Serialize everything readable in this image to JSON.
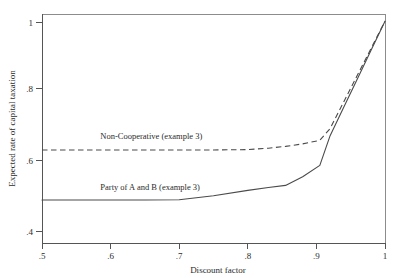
{
  "chart_data": {
    "type": "line",
    "title": "",
    "xlabel": "Discount factor",
    "ylabel": "Expected rate of capital taxation",
    "xlim": [
      0.5,
      1.0
    ],
    "ylim": [
      0.38,
      1.02
    ],
    "xticks": [
      0.5,
      0.6,
      0.7,
      0.8,
      0.9,
      1.0
    ],
    "xticklabels": [
      ".5",
      ".6",
      ".7",
      ".8",
      ".9",
      "1"
    ],
    "yticks": [
      0.4,
      0.6,
      0.8,
      1.0
    ],
    "yticklabels": [
      ".4",
      ".6",
      ".8",
      "1"
    ],
    "grid": false,
    "legend_position": "inline-annotation",
    "series": [
      {
        "name": "Non-Cooperative (example 3)",
        "style": "dashed",
        "color": "#4a4a4a",
        "x": [
          0.5,
          0.55,
          0.6,
          0.65,
          0.7,
          0.75,
          0.8,
          0.83,
          0.855,
          0.88,
          0.905,
          0.92,
          0.94,
          0.96,
          0.98,
          1.0
        ],
        "values": [
          0.64,
          0.64,
          0.64,
          0.64,
          0.64,
          0.64,
          0.641,
          0.645,
          0.65,
          0.657,
          0.667,
          0.7,
          0.775,
          0.85,
          0.925,
          1.0
        ]
      },
      {
        "name": "Party of A and B (example 3)",
        "style": "solid",
        "color": "#4a4a4a",
        "x": [
          0.5,
          0.55,
          0.6,
          0.65,
          0.7,
          0.75,
          0.8,
          0.83,
          0.855,
          0.88,
          0.905,
          0.92,
          0.94,
          0.96,
          0.98,
          1.0
        ],
        "values": [
          0.5,
          0.5,
          0.5,
          0.5,
          0.501,
          0.512,
          0.527,
          0.535,
          0.541,
          0.565,
          0.597,
          0.68,
          0.76,
          0.84,
          0.92,
          1.0
        ]
      }
    ],
    "annotations": [
      {
        "text": "Non-Cooperative (example 3)",
        "x": 0.585,
        "y": 0.672
      },
      {
        "text": "Party of A and B (example 3)",
        "x": 0.585,
        "y": 0.528
      }
    ]
  }
}
